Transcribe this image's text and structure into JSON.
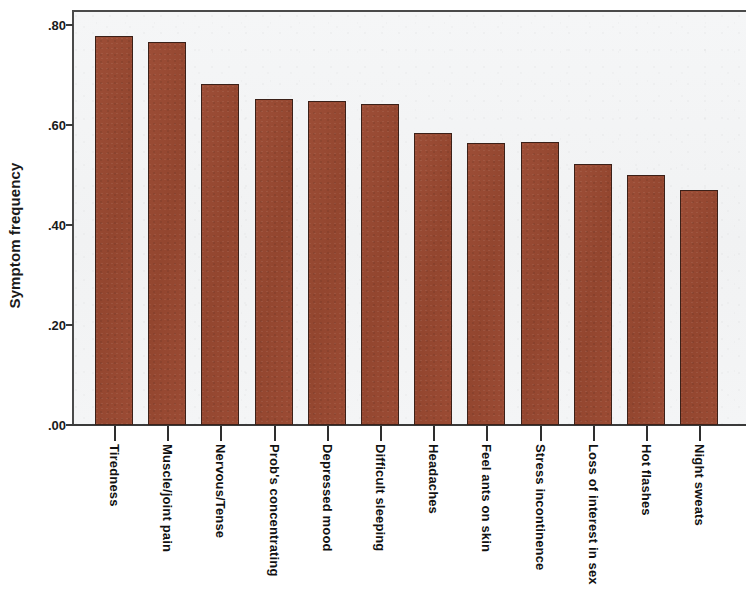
{
  "chart_data": {
    "type": "bar",
    "title": "",
    "subtitle": "",
    "xlabel": "",
    "ylabel": "Symptom frequency",
    "ylim": [
      0.0,
      0.85
    ],
    "yticks": [
      ".00",
      ".20",
      ".40",
      ".60",
      ".80"
    ],
    "ytick_values": [
      0.0,
      0.2,
      0.4,
      0.6,
      0.8
    ],
    "grid": false,
    "legend": null,
    "bar_color": "#9a4b35",
    "plot_background": "#f3f4f5",
    "categories": [
      "Tiredness",
      "Muscle/joint pain",
      "Nervous/Tense",
      "Prob's concentrating",
      "Depressed mood",
      "Difficult sleeping",
      "Headaches",
      "Feel ants on skin",
      "Stress incontinence",
      "Loss of interest in sex",
      "Hot flashes",
      "Night sweats"
    ],
    "values": [
      0.778,
      0.766,
      0.682,
      0.652,
      0.648,
      0.642,
      0.585,
      0.564,
      0.566,
      0.522,
      0.5,
      0.47
    ]
  }
}
